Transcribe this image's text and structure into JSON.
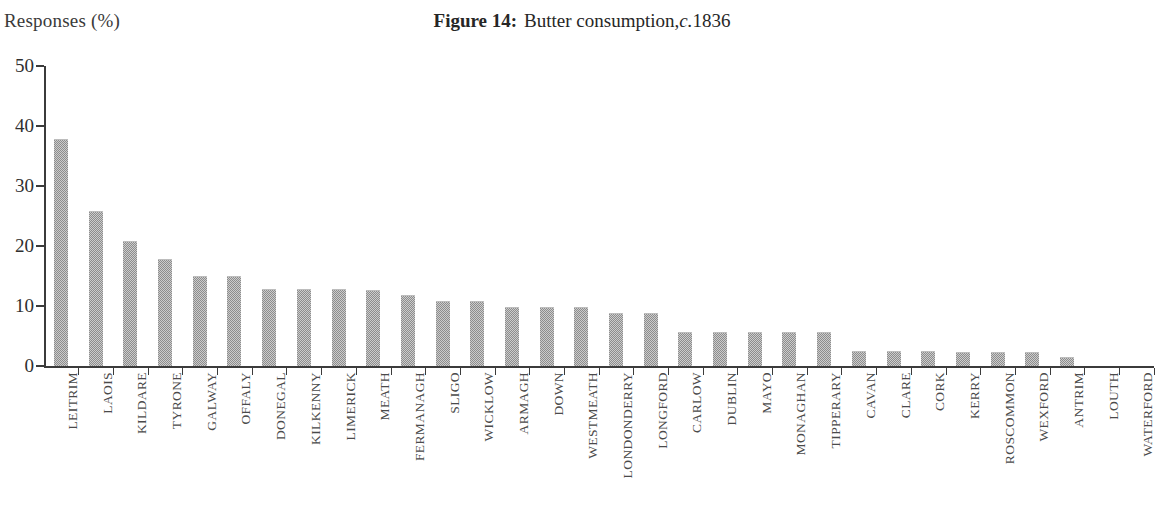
{
  "figure": {
    "label": "Figure 14:",
    "caption": "Butter consumption,",
    "circa": "c.",
    "year": "1836",
    "full_title": "Figure 14: Butter consumption, c.1836"
  },
  "y_axis_caption": "Responses (%)",
  "colors": {
    "bar_fill": "#8d8d8d",
    "axis": "#3b3b3b",
    "text": "#2b2b2b",
    "label_text": "#4a4a4a",
    "background": "#ffffff"
  },
  "y_ticks": [
    {
      "value": 0,
      "label": "0"
    },
    {
      "value": 10,
      "label": "10"
    },
    {
      "value": 20,
      "label": "20"
    },
    {
      "value": 30,
      "label": "30"
    },
    {
      "value": 40,
      "label": "40"
    },
    {
      "value": 50,
      "label": "50"
    }
  ],
  "chart_data": {
    "type": "bar",
    "xlabel": "",
    "ylabel": "Responses (%)",
    "ylim": [
      0,
      50
    ],
    "ytick_step": 10,
    "grid": false,
    "legend": false,
    "orientation": "vertical",
    "categories": [
      "LEITRIM",
      "LAOIS",
      "KILDARE",
      "TYRONE",
      "GALWAY",
      "OFFALY",
      "DONEGAL",
      "KILKENNY",
      "LIMERICK",
      "MEATH",
      "FERMANAGH",
      "SLIGO",
      "WICKLOW",
      "ARMAGH",
      "DOWN",
      "WESTMEATH",
      "LONDONDERRY",
      "LONGFORD",
      "CARLOW",
      "DUBLIN",
      "MAYO",
      "MONAGHAN",
      "TIPPERARY",
      "CAVAN",
      "CLARE",
      "CORK",
      "KERRY",
      "ROSCOMMON",
      "WEXFORD",
      "ANTRIM",
      "LOUTH",
      "WATERFORD"
    ],
    "values": [
      37.8,
      25.9,
      20.9,
      17.9,
      15.0,
      15.0,
      12.8,
      12.8,
      12.8,
      12.7,
      11.9,
      10.8,
      10.8,
      9.8,
      9.8,
      9.8,
      8.8,
      8.8,
      5.6,
      5.6,
      5.6,
      5.6,
      5.6,
      2.5,
      2.5,
      2.5,
      2.4,
      2.4,
      2.4,
      1.5,
      0,
      0
    ]
  }
}
